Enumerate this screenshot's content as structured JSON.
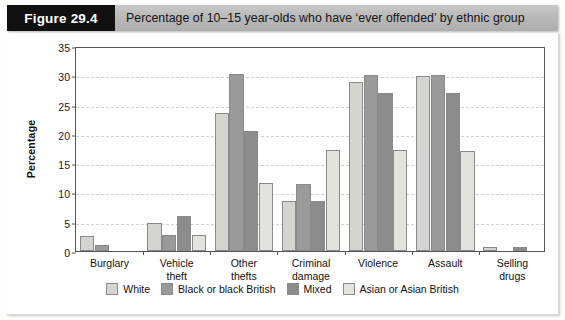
{
  "figure": {
    "tag": "Figure 29.4",
    "title": "Percentage of 10–15 year-olds who have ‘ever offended’ by ethnic group"
  },
  "chart_data": {
    "type": "bar",
    "title": "Percentage of 10–15 year-olds who have ‘ever offended’ by ethnic group",
    "xlabel": "",
    "ylabel": "Percentage",
    "ylim": [
      0,
      35
    ],
    "yticks": [
      0,
      5,
      10,
      15,
      20,
      25,
      30,
      35
    ],
    "grid": true,
    "legend_position": "bottom",
    "categories": [
      "Burglary",
      "Vehicle theft",
      "Other thefts",
      "Criminal damage",
      "Violence",
      "Assault",
      "Selling drugs"
    ],
    "series": [
      {
        "name": "White",
        "color": "#d4d4d0",
        "values": [
          2.6,
          4.8,
          23.5,
          8.6,
          28.9,
          29.8,
          0.7
        ]
      },
      {
        "name": "Black or black British",
        "color": "#9a9a9a",
        "values": [
          1.0,
          2.7,
          30.2,
          11.5,
          30.0,
          30.0,
          0
        ]
      },
      {
        "name": "Mixed",
        "color": "#8c8c8c",
        "values": [
          0,
          6.0,
          20.5,
          8.6,
          26.9,
          26.9,
          0.7
        ]
      },
      {
        "name": "Asian or Asian British",
        "color": "#e2e2de",
        "values": [
          0,
          2.7,
          11.6,
          17.3,
          17.2,
          17.1,
          0
        ]
      }
    ]
  }
}
